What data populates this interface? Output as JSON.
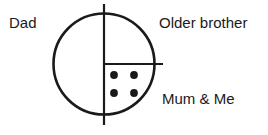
{
  "canvas": {
    "width": 268,
    "height": 135,
    "background_color": "#ffffff"
  },
  "diagram": {
    "type": "circle-partition",
    "stroke_color": "#1a1a1a",
    "fill_color": "#ffffff",
    "dot_color": "#1a1a1a",
    "circle": {
      "center_x": 104,
      "center_y": 64,
      "radius": 50.5,
      "stroke_width": 2.6
    },
    "vertical_divider": {
      "x": 104,
      "y_top": 4,
      "y_bottom": 125,
      "stroke_width": 2.2
    },
    "horizontal_divider": {
      "y": 64,
      "x_start": 104,
      "x_end": 163,
      "stroke_width": 2.2
    },
    "dots": {
      "count": 4,
      "radius": 3.9,
      "positions": [
        {
          "cx": 114,
          "cy": 75
        },
        {
          "cx": 134,
          "cy": 75
        },
        {
          "cx": 114,
          "cy": 93
        },
        {
          "cx": 134,
          "cy": 93
        }
      ]
    }
  },
  "labels": {
    "dad": "Dad",
    "older_brother": "Older brother",
    "mum_and_me": "Mum & Me"
  }
}
